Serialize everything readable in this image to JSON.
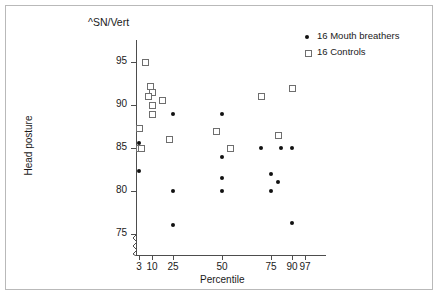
{
  "chart_data": {
    "type": "scatter",
    "title": "^SN/Vert",
    "xlabel": "Percentile",
    "ylabel": "Head posture",
    "grid": false,
    "legend_position": "top-right",
    "axis_break": "y-axis broken below 75",
    "xticks": [
      "3",
      "10",
      "25",
      "50",
      "75",
      "90",
      "97"
    ],
    "xtick_values": [
      3,
      10,
      25,
      50,
      75,
      90,
      97
    ],
    "yticks": [
      "75",
      "80",
      "85",
      "90",
      "95"
    ],
    "ytick_values": [
      75,
      80,
      85,
      90,
      95
    ],
    "ylim": [
      73,
      97
    ],
    "xscale": "probit-percentile",
    "series": [
      {
        "name": "16 Mouth breathers",
        "marker": "filled-circle",
        "color": "#111111",
        "count": 16,
        "points": [
          {
            "x": 3,
            "y": 85.6
          },
          {
            "x": 3,
            "y": 82.3
          },
          {
            "x": 25,
            "y": 89.0
          },
          {
            "x": 25,
            "y": 80.0
          },
          {
            "x": 25,
            "y": 76.0
          },
          {
            "x": 50,
            "y": 89.0
          },
          {
            "x": 50,
            "y": 84.0
          },
          {
            "x": 50,
            "y": 81.5
          },
          {
            "x": 50,
            "y": 80.0
          },
          {
            "x": 70,
            "y": 85.0
          },
          {
            "x": 75,
            "y": 82.0
          },
          {
            "x": 75,
            "y": 80.0
          },
          {
            "x": 80,
            "y": 81.0
          },
          {
            "x": 82,
            "y": 85.0
          },
          {
            "x": 90,
            "y": 85.0
          },
          {
            "x": 90,
            "y": 76.3
          }
        ]
      },
      {
        "name": "16 Controls",
        "marker": "open-square",
        "color": "#6e6e6e",
        "count": 16,
        "points": [
          {
            "x": 6,
            "y": 95.0
          },
          {
            "x": 9,
            "y": 92.2
          },
          {
            "x": 10,
            "y": 91.5
          },
          {
            "x": 8,
            "y": 91.0
          },
          {
            "x": 10,
            "y": 90.0
          },
          {
            "x": 10,
            "y": 89.0
          },
          {
            "x": 17,
            "y": 90.6
          },
          {
            "x": 22,
            "y": 86.0
          },
          {
            "x": 3,
            "y": 87.3
          },
          {
            "x": 3,
            "y": 85.0
          },
          {
            "x": 4,
            "y": 85.0
          },
          {
            "x": 47,
            "y": 87.0
          },
          {
            "x": 54,
            "y": 85.0
          },
          {
            "x": 70,
            "y": 91.0
          },
          {
            "x": 80,
            "y": 86.5
          },
          {
            "x": 90,
            "y": 92.0
          }
        ]
      }
    ]
  },
  "legend": {
    "items": [
      {
        "label": "16 Mouth breathers",
        "marker": "filled-circle"
      },
      {
        "label": "16 Controls",
        "marker": "open-square"
      }
    ]
  }
}
